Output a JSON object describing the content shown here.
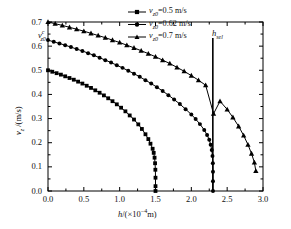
{
  "chart_data": {
    "type": "line",
    "title": "",
    "xlabel": "h/(×10⁻⁴ m)",
    "ylabel": "v_z /(m/s)",
    "xlim": [
      0.0,
      3.0
    ],
    "ylim": [
      0.0,
      0.7
    ],
    "xticks": [
      "0.0",
      "0.5",
      "1.0",
      "1.5",
      "2.0",
      "2.5",
      "3.0"
    ],
    "xtick_values": [
      0.0,
      0.5,
      1.0,
      1.5,
      2.0,
      2.5,
      3.0
    ],
    "yticks": [
      "0.0",
      "0.1",
      "0.2",
      "0.3",
      "0.4",
      "0.5",
      "0.6",
      "0.7"
    ],
    "ytick_values": [
      0.0,
      0.1,
      0.2,
      0.3,
      0.4,
      0.5,
      0.6,
      0.7
    ],
    "grid": false,
    "legend_position": "top-center",
    "series": [
      {
        "name": "v_z0=0.5 m/s",
        "marker": "square",
        "color": "#000000",
        "points": [
          [
            0.0,
            0.5
          ],
          [
            0.06,
            0.494
          ],
          [
            0.12,
            0.488
          ],
          [
            0.18,
            0.482
          ],
          [
            0.24,
            0.475
          ],
          [
            0.3,
            0.468
          ],
          [
            0.36,
            0.461
          ],
          [
            0.42,
            0.453
          ],
          [
            0.48,
            0.445
          ],
          [
            0.54,
            0.436
          ],
          [
            0.6,
            0.427
          ],
          [
            0.66,
            0.417
          ],
          [
            0.72,
            0.407
          ],
          [
            0.78,
            0.396
          ],
          [
            0.84,
            0.384
          ],
          [
            0.9,
            0.372
          ],
          [
            0.96,
            0.359
          ],
          [
            1.02,
            0.345
          ],
          [
            1.08,
            0.33
          ],
          [
            1.14,
            0.313
          ],
          [
            1.2,
            0.296
          ],
          [
            1.26,
            0.276
          ],
          [
            1.31,
            0.257
          ],
          [
            1.36,
            0.235
          ],
          [
            1.4,
            0.215
          ],
          [
            1.43,
            0.196
          ],
          [
            1.46,
            0.175
          ],
          [
            1.475,
            0.158
          ],
          [
            1.487,
            0.138
          ],
          [
            1.494,
            0.115
          ],
          [
            1.498,
            0.088
          ],
          [
            1.5,
            0.055
          ],
          [
            1.5,
            0.02
          ],
          [
            1.5,
            0.0
          ]
        ]
      },
      {
        "name": "v_z0=0.62 m/s",
        "marker": "circle",
        "color": "#000000",
        "points": [
          [
            0.0,
            0.625
          ],
          [
            0.08,
            0.618
          ],
          [
            0.16,
            0.611
          ],
          [
            0.24,
            0.604
          ],
          [
            0.32,
            0.596
          ],
          [
            0.4,
            0.588
          ],
          [
            0.48,
            0.58
          ],
          [
            0.56,
            0.571
          ],
          [
            0.64,
            0.562
          ],
          [
            0.72,
            0.552
          ],
          [
            0.8,
            0.542
          ],
          [
            0.88,
            0.532
          ],
          [
            0.96,
            0.521
          ],
          [
            1.04,
            0.51
          ],
          [
            1.12,
            0.498
          ],
          [
            1.2,
            0.486
          ],
          [
            1.28,
            0.473
          ],
          [
            1.36,
            0.459
          ],
          [
            1.44,
            0.445
          ],
          [
            1.52,
            0.43
          ],
          [
            1.6,
            0.414
          ],
          [
            1.68,
            0.397
          ],
          [
            1.76,
            0.379
          ],
          [
            1.84,
            0.36
          ],
          [
            1.92,
            0.339
          ],
          [
            2.0,
            0.317
          ],
          [
            2.06,
            0.298
          ],
          [
            2.12,
            0.277
          ],
          [
            2.18,
            0.253
          ],
          [
            2.22,
            0.232
          ],
          [
            2.25,
            0.212
          ],
          [
            2.27,
            0.192
          ],
          [
            2.285,
            0.17
          ],
          [
            2.295,
            0.145
          ],
          [
            2.3,
            0.115
          ],
          [
            2.302,
            0.08
          ],
          [
            2.302,
            0.04
          ],
          [
            2.302,
            0.0
          ]
        ]
      },
      {
        "name": "v_z0=0.7 m/s",
        "marker": "triangle",
        "color": "#000000",
        "points": [
          [
            0.0,
            0.7
          ],
          [
            0.1,
            0.693
          ],
          [
            0.2,
            0.686
          ],
          [
            0.3,
            0.678
          ],
          [
            0.4,
            0.67
          ],
          [
            0.5,
            0.662
          ],
          [
            0.6,
            0.653
          ],
          [
            0.7,
            0.644
          ],
          [
            0.8,
            0.635
          ],
          [
            0.9,
            0.625
          ],
          [
            1.0,
            0.615
          ],
          [
            1.1,
            0.604
          ],
          [
            1.2,
            0.593
          ],
          [
            1.3,
            0.581
          ],
          [
            1.4,
            0.569
          ],
          [
            1.5,
            0.556
          ],
          [
            1.6,
            0.542
          ],
          [
            1.7,
            0.528
          ],
          [
            1.8,
            0.512
          ],
          [
            1.9,
            0.496
          ],
          [
            2.0,
            0.478
          ],
          [
            2.1,
            0.459
          ],
          [
            2.2,
            0.438
          ],
          [
            2.31,
            0.32
          ],
          [
            2.4,
            0.372
          ],
          [
            2.5,
            0.338
          ],
          [
            2.58,
            0.305
          ],
          [
            2.66,
            0.268
          ],
          [
            2.73,
            0.23
          ],
          [
            2.79,
            0.192
          ],
          [
            2.84,
            0.155
          ],
          [
            2.88,
            0.118
          ],
          [
            2.9,
            0.083
          ]
        ]
      }
    ],
    "reference_lines": [
      {
        "name": "h_sel",
        "label": "h_sel",
        "orientation": "vertical",
        "x": 2.3,
        "color": "#000000"
      }
    ],
    "annotations": [
      {
        "name": "vzc-annotation",
        "text": "v_z0^c",
        "x": 0.06,
        "y": 0.645
      }
    ]
  },
  "legend": {
    "entries": [
      {
        "label_prefix": "v",
        "label_sub": "z0",
        "label_rest": "=0.5 m/s",
        "marker": "square"
      },
      {
        "label_prefix": "v",
        "label_sub": "z0",
        "label_rest": "=0.62 m/s",
        "marker": "circle"
      },
      {
        "label_prefix": "v",
        "label_sub": "z0",
        "label_rest": "=0.7 m/s",
        "marker": "triangle"
      }
    ]
  },
  "axis_labels": {
    "x_main": "h",
    "x_rest": "/(×10",
    "x_exp": "−4",
    "x_tail": "m)",
    "y_main": "v",
    "y_sub": "z",
    "y_rest": " /(m/s)"
  },
  "ref_label": {
    "main": "h",
    "sub": "sel"
  },
  "annotation_label": {
    "main": "v",
    "sup": "c",
    "sub": "z0"
  }
}
